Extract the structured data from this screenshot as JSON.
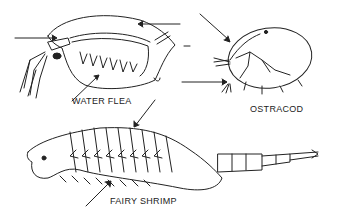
{
  "diagram": {
    "subjects": [
      {
        "id": "water-flea",
        "label": "WATER FLEA"
      },
      {
        "id": "ostracod",
        "label": "OSTRACOD"
      },
      {
        "id": "fairy-shrimp",
        "label": "FAIRY SHRIMP"
      }
    ],
    "colors": {
      "line": "#222222",
      "background": "#ffffff"
    }
  }
}
